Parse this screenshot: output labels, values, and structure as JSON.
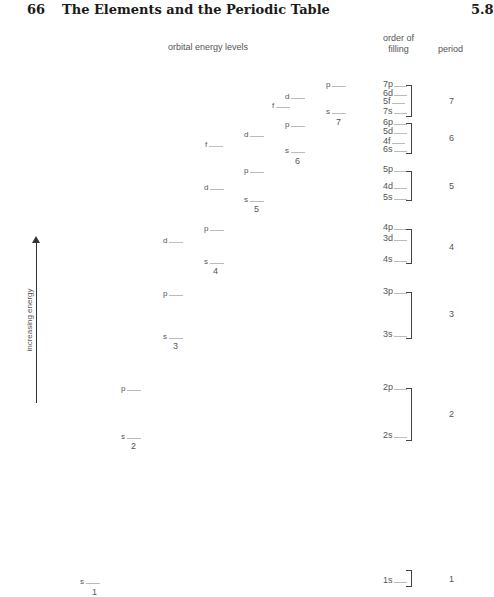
{
  "header": {
    "page_number": "66",
    "title": "The Elements and the Periodic Table",
    "section": "5.8"
  },
  "columns": {
    "orbital_levels": "orbital energy levels",
    "order_line1": "order of",
    "order_line2": "filling",
    "period": "period"
  },
  "axis": {
    "label": "increasing energy"
  },
  "levels": [
    {
      "t": "p",
      "x": 326,
      "y": 80
    },
    {
      "t": "s",
      "x": 326,
      "y": 107
    },
    {
      "n": "7",
      "x": 336,
      "y": 117
    },
    {
      "t": "d",
      "x": 285,
      "y": 92
    },
    {
      "t": "f",
      "x": 272,
      "y": 101
    },
    {
      "t": "p",
      "x": 285,
      "y": 120
    },
    {
      "t": "s",
      "x": 285,
      "y": 146
    },
    {
      "n": "6",
      "x": 295,
      "y": 156
    },
    {
      "t": "d",
      "x": 244,
      "y": 130
    },
    {
      "t": "f",
      "x": 205,
      "y": 140
    },
    {
      "t": "p",
      "x": 244,
      "y": 166
    },
    {
      "t": "s",
      "x": 244,
      "y": 195
    },
    {
      "n": "5",
      "x": 254,
      "y": 204
    },
    {
      "t": "d",
      "x": 204,
      "y": 183
    },
    {
      "t": "p",
      "x": 204,
      "y": 224
    },
    {
      "t": "d",
      "x": 163,
      "y": 236
    },
    {
      "t": "s",
      "x": 204,
      "y": 257
    },
    {
      "n": "4",
      "x": 213,
      "y": 266
    },
    {
      "t": "p",
      "x": 163,
      "y": 289
    },
    {
      "t": "s",
      "x": 163,
      "y": 332
    },
    {
      "n": "3",
      "x": 173,
      "y": 341
    },
    {
      "t": "p",
      "x": 121,
      "y": 384
    },
    {
      "t": "s",
      "x": 121,
      "y": 432
    },
    {
      "n": "2",
      "x": 131,
      "y": 441
    },
    {
      "t": "s",
      "x": 80,
      "y": 577
    },
    {
      "n": "1",
      "x": 92,
      "y": 587
    }
  ],
  "order_of_filling": [
    {
      "label": "7p",
      "y": 80
    },
    {
      "label": "6d",
      "y": 89
    },
    {
      "label": "5f",
      "y": 97
    },
    {
      "label": "7s",
      "y": 107
    },
    {
      "label": "6p",
      "y": 118
    },
    {
      "label": "5d",
      "y": 127
    },
    {
      "label": "4f",
      "y": 137
    },
    {
      "label": "6s",
      "y": 145
    },
    {
      "label": "5p",
      "y": 165
    },
    {
      "label": "4d",
      "y": 182
    },
    {
      "label": "5s",
      "y": 193
    },
    {
      "label": "4p",
      "y": 223
    },
    {
      "label": "3d",
      "y": 234
    },
    {
      "label": "4s",
      "y": 255
    },
    {
      "label": "3p",
      "y": 287
    },
    {
      "label": "3s",
      "y": 330
    },
    {
      "label": "2p",
      "y": 383
    },
    {
      "label": "2s",
      "y": 431
    },
    {
      "label": "1s",
      "y": 576
    }
  ],
  "brackets": [
    {
      "top": 85,
      "bottom": 115
    },
    {
      "top": 123,
      "bottom": 152
    },
    {
      "top": 171,
      "bottom": 199
    },
    {
      "top": 229,
      "bottom": 262
    },
    {
      "top": 292,
      "bottom": 337
    },
    {
      "top": 388,
      "bottom": 439
    },
    {
      "top": 570,
      "bottom": 585
    }
  ],
  "periods": [
    {
      "label": "7",
      "y": 96
    },
    {
      "label": "6",
      "y": 133
    },
    {
      "label": "5",
      "y": 181
    },
    {
      "label": "4",
      "y": 242
    },
    {
      "label": "3",
      "y": 309
    },
    {
      "label": "2",
      "y": 409
    },
    {
      "label": "1",
      "y": 574
    }
  ]
}
